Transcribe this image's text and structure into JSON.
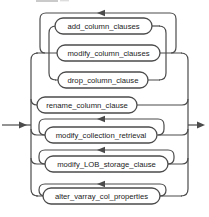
{
  "diagram": {
    "type": "railroad-syntax-diagram",
    "colors": {
      "background": "#ffffff",
      "line": "#4b4b4b",
      "node_fill": "#ffffff",
      "node_text": "#1b1b1b"
    },
    "flow": {
      "entry_arrow": "right-pointing",
      "exit_arrow": "right-pointing",
      "loop_arrow": "left-pointing"
    },
    "nodes": [
      {
        "label": "add_column_clauses",
        "shape": "stadium"
      },
      {
        "label": "modify_column_clauses",
        "shape": "stadium"
      },
      {
        "label": "drop_column_clause",
        "shape": "stadium"
      },
      {
        "label": "rename_column_clause",
        "shape": "stadium"
      },
      {
        "label": "modify_collection_retrieval",
        "shape": "stadium"
      },
      {
        "label": "modify_LOB_storage_clause",
        "shape": "stadium"
      },
      {
        "label": "alter_varray_col_properties",
        "shape": "stadium"
      }
    ],
    "structure": {
      "alternatives": [
        {
          "repeatable": true,
          "choices": [
            "add_column_clauses",
            "modify_column_clauses",
            "drop_column_clause"
          ]
        },
        {
          "repeatable": false,
          "choices": [
            "rename_column_clause"
          ]
        },
        {
          "repeatable": true,
          "choices": [
            "modify_collection_retrieval"
          ]
        },
        {
          "repeatable": true,
          "choices": [
            "modify_LOB_storage_clause"
          ]
        },
        {
          "repeatable": true,
          "choices": [
            "alter_varray_col_properties"
          ]
        }
      ]
    }
  }
}
